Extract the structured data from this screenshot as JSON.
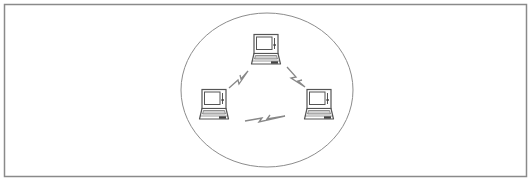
{
  "diagram": {
    "type": "ad-hoc wireless network",
    "frame": {
      "x": 4.5,
      "y": 4.5,
      "width": 522,
      "height": 172,
      "stroke": "#8a8a8a",
      "stroke_width": 1.5
    },
    "network_boundary": {
      "shape": "ellipse",
      "cx": 267,
      "cy": 90,
      "rx": 86,
      "ry": 77,
      "stroke": "#8c8c8c",
      "stroke_width": 1
    },
    "nodes": [
      {
        "id": "laptop-top",
        "icon": "laptop-icon",
        "x": 252,
        "y": 34
      },
      {
        "id": "laptop-left",
        "icon": "laptop-icon",
        "x": 200,
        "y": 89
      },
      {
        "id": "laptop-right",
        "icon": "laptop-icon",
        "x": 305,
        "y": 89
      }
    ],
    "links": [
      {
        "id": "link-top-left",
        "icon": "wireless-signal-icon",
        "from": "laptop-top",
        "to": "laptop-left",
        "points": "229,88 238,80 239,84 248,71 241,79 240,75"
      },
      {
        "id": "link-top-right",
        "icon": "wireless-signal-icon",
        "from": "laptop-top",
        "to": "laptop-right",
        "points": "287,67 296,77 291,78 305,87 298,81 302,80"
      },
      {
        "id": "link-left-right",
        "icon": "wireless-signal-icon",
        "from": "laptop-left",
        "to": "laptop-right",
        "points": "245,121 262,118 259,122 285,116 267,119 270,115"
      }
    ],
    "colors": {
      "line": "#8c8c8c",
      "laptop_outline": "#555555",
      "laptop_fill": "#ffffff",
      "screen_fill": "#ffffff",
      "keyboard_shade": "#cfcfcf",
      "dark_detail": "#444444",
      "bolt": "#888888"
    }
  }
}
